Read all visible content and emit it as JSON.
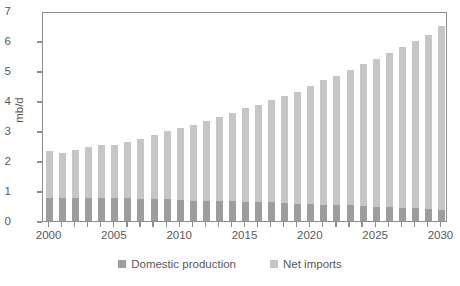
{
  "chart_data": {
    "type": "bar",
    "stacked": true,
    "title": "",
    "subtitle": "",
    "xlabel": "",
    "ylabel": "mb/d",
    "ylim": [
      0,
      7
    ],
    "ytick_values": [
      0,
      1,
      2,
      3,
      4,
      5,
      6,
      7
    ],
    "ytick_labels": [
      "0",
      "1",
      "2",
      "3",
      "4",
      "5",
      "6",
      "7"
    ],
    "grid": false,
    "legend_position": "bottom",
    "xlim_years": [
      2000,
      2030
    ],
    "categories": [
      "2000",
      "2001",
      "2002",
      "2003",
      "2004",
      "2005",
      "2006",
      "2007",
      "2008",
      "2009",
      "2010",
      "2011",
      "2012",
      "2013",
      "2014",
      "2015",
      "2016",
      "2017",
      "2018",
      "2019",
      "2020",
      "2021",
      "2022",
      "2023",
      "2024",
      "2025",
      "2026",
      "2027",
      "2028",
      "2029",
      "2030"
    ],
    "xtick_labels": [
      "2000",
      "2005",
      "2010",
      "2015",
      "2020",
      "2025",
      "2030"
    ],
    "xtick_label_years": [
      2000,
      2005,
      2010,
      2015,
      2020,
      2025,
      2030
    ],
    "series": [
      {
        "name": "Domestic production",
        "color": "#9d9d9d",
        "values": [
          0.78,
          0.78,
          0.78,
          0.78,
          0.78,
          0.78,
          0.78,
          0.75,
          0.73,
          0.72,
          0.7,
          0.68,
          0.68,
          0.68,
          0.66,
          0.65,
          0.63,
          0.62,
          0.6,
          0.58,
          0.57,
          0.55,
          0.53,
          0.52,
          0.5,
          0.48,
          0.47,
          0.45,
          0.43,
          0.4,
          0.38
        ]
      },
      {
        "name": "Net imports",
        "color": "#c6c6c6",
        "values": [
          1.54,
          1.48,
          1.6,
          1.68,
          1.77,
          1.77,
          1.87,
          2.0,
          2.14,
          2.27,
          2.4,
          2.52,
          2.67,
          2.79,
          2.95,
          3.12,
          3.25,
          3.41,
          3.56,
          3.72,
          3.92,
          4.14,
          4.31,
          4.53,
          4.75,
          4.92,
          5.13,
          5.35,
          5.57,
          5.8,
          6.12
        ]
      }
    ],
    "totals": [
      2.32,
      2.26,
      2.38,
      2.46,
      2.55,
      2.55,
      2.65,
      2.75,
      2.87,
      2.99,
      3.1,
      3.2,
      3.35,
      3.47,
      3.61,
      3.77,
      3.88,
      4.03,
      4.16,
      4.3,
      4.49,
      4.69,
      4.84,
      5.05,
      5.25,
      5.4,
      5.6,
      5.8,
      6.0,
      6.2,
      6.5
    ]
  },
  "colors": {
    "domestic": "#9d9d9d",
    "imports": "#c6c6c6",
    "axis": "#8d8d8d",
    "text": "#58585a",
    "background": "#ffffff"
  },
  "legend": {
    "items": [
      {
        "label": "Domestic production",
        "color": "#9d9d9d"
      },
      {
        "label": "Net imports",
        "color": "#c6c6c6"
      }
    ]
  }
}
